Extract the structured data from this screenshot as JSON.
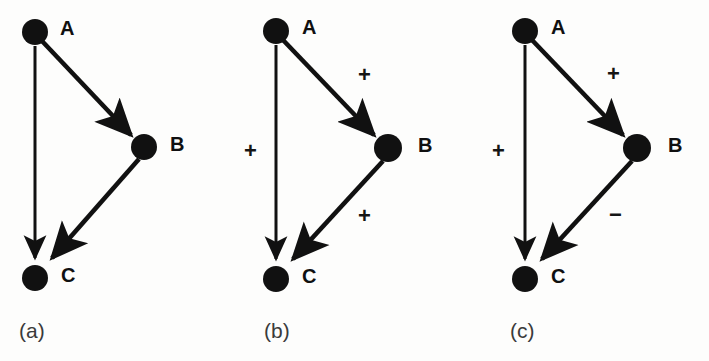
{
  "figure": {
    "background_color": "#fdfdfc",
    "ink_color": "#111111",
    "width": 709,
    "height": 361
  },
  "panels": [
    {
      "id": "a",
      "caption": "(a)",
      "nodes": [
        {
          "id": "A",
          "label": "A",
          "x": 35,
          "y": 32,
          "r": 13,
          "label_x": 60,
          "label_y": 18
        },
        {
          "id": "B",
          "label": "B",
          "x": 144,
          "y": 147,
          "r": 13,
          "label_x": 170,
          "label_y": 133
        },
        {
          "id": "C",
          "label": "C",
          "x": 35,
          "y": 278,
          "r": 13,
          "label_x": 61,
          "label_y": 264
        }
      ],
      "edges": [
        {
          "from": "A",
          "to": "B",
          "sign": ""
        },
        {
          "from": "A",
          "to": "C",
          "sign": ""
        },
        {
          "from": "B",
          "to": "C",
          "sign": ""
        }
      ],
      "signs": []
    },
    {
      "id": "b",
      "caption": "(b)",
      "nodes": [
        {
          "id": "A",
          "label": "A",
          "x": 40,
          "y": 31,
          "r": 13,
          "label_x": 66,
          "label_y": 17
        },
        {
          "id": "B",
          "label": "B",
          "x": 152,
          "y": 148,
          "r": 14,
          "label_x": 182,
          "label_y": 134
        },
        {
          "id": "C",
          "label": "C",
          "x": 40,
          "y": 279,
          "r": 13,
          "label_x": 66,
          "label_y": 265
        }
      ],
      "edges": [
        {
          "from": "A",
          "to": "B",
          "sign": "+"
        },
        {
          "from": "A",
          "to": "C",
          "sign": "+"
        },
        {
          "from": "B",
          "to": "C",
          "sign": "+"
        }
      ],
      "signs": [
        {
          "text": "+",
          "x": 122,
          "y": 64,
          "for_edge": "A->B"
        },
        {
          "text": "+",
          "x": 8,
          "y": 140,
          "for_edge": "A->C"
        },
        {
          "text": "+",
          "x": 122,
          "y": 205,
          "for_edge": "B->C"
        }
      ]
    },
    {
      "id": "c",
      "caption": "(c)",
      "nodes": [
        {
          "id": "A",
          "label": "A",
          "x": 53,
          "y": 31,
          "r": 13,
          "label_x": 79,
          "label_y": 17
        },
        {
          "id": "B",
          "label": "B",
          "x": 165,
          "y": 148,
          "r": 14,
          "label_x": 196,
          "label_y": 134
        },
        {
          "id": "C",
          "label": "C",
          "x": 53,
          "y": 279,
          "r": 13,
          "label_x": 79,
          "label_y": 265
        }
      ],
      "edges": [
        {
          "from": "A",
          "to": "B",
          "sign": "+"
        },
        {
          "from": "A",
          "to": "C",
          "sign": "+"
        },
        {
          "from": "B",
          "to": "C",
          "sign": "−"
        }
      ],
      "signs": [
        {
          "text": "+",
          "x": 135,
          "y": 63,
          "for_edge": "A->B"
        },
        {
          "text": "+",
          "x": 20,
          "y": 140,
          "for_edge": "A->C"
        },
        {
          "text": "−",
          "x": 137,
          "y": 205,
          "for_edge": "B->C"
        }
      ]
    }
  ],
  "captions": {
    "a": {
      "text": "(a)",
      "x": 19,
      "y": 320
    },
    "b": {
      "text": "(b)",
      "x": 264,
      "y": 320
    },
    "c": {
      "text": "(c)",
      "x": 510,
      "y": 320
    }
  }
}
